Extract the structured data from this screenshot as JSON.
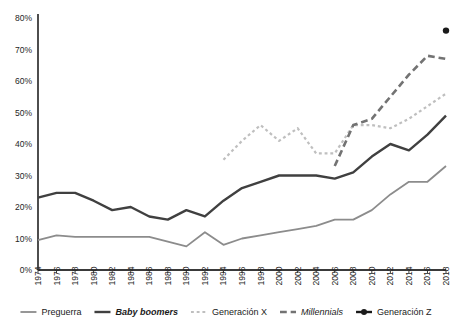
{
  "chart_data": {
    "type": "line",
    "title": "",
    "xlabel": "",
    "ylabel": "",
    "ylim": [
      0,
      0.8
    ],
    "ytick_labels": [
      "0%",
      "10%",
      "20%",
      "30%",
      "40%",
      "50%",
      "60%",
      "70%",
      "80%"
    ],
    "ytick_values": [
      0,
      10,
      20,
      30,
      40,
      50,
      60,
      70,
      80
    ],
    "x": [
      1974,
      1976,
      1978,
      1980,
      1982,
      1984,
      1986,
      1988,
      1990,
      1992,
      1994,
      1996,
      1998,
      2000,
      2002,
      2004,
      2006,
      2008,
      2010,
      2012,
      2014,
      2016,
      2018
    ],
    "xtick_labels": [
      "1974",
      "1976",
      "1978",
      "1980",
      "1982",
      "1984",
      "1986",
      "1988",
      "1990",
      "1992",
      "1994",
      "1996",
      "1998",
      "2000",
      "2002",
      "2004",
      "2006",
      "2008",
      "2010",
      "2012",
      "2014",
      "2016",
      "2018"
    ],
    "grid": false,
    "legend_position": "bottom",
    "series": [
      {
        "name": "Preguerra",
        "color": "#8c8c8c",
        "style": "solid",
        "width": 1.8,
        "marker": "none",
        "x": [
          1974,
          1976,
          1978,
          1980,
          1982,
          1984,
          1986,
          1988,
          1990,
          1992,
          1994,
          1996,
          1998,
          2000,
          2002,
          2004,
          2006,
          2008,
          2010,
          2012,
          2014,
          2016,
          2018
        ],
        "values": [
          9.5,
          11,
          10.5,
          10.5,
          10.5,
          10.5,
          10.5,
          9,
          7.5,
          12,
          8,
          10,
          11,
          12,
          13,
          14,
          16,
          16,
          19,
          24,
          28,
          28,
          33
        ]
      },
      {
        "name": "Baby boomers",
        "color": "#404040",
        "style": "solid",
        "width": 2.4,
        "marker": "none",
        "x": [
          1974,
          1976,
          1978,
          1980,
          1982,
          1984,
          1986,
          1988,
          1990,
          1992,
          1994,
          1996,
          1998,
          2000,
          2002,
          2004,
          2006,
          2008,
          2010,
          2012,
          2014,
          2016,
          2018
        ],
        "values": [
          23,
          24.5,
          24.5,
          22,
          19,
          20,
          17,
          16,
          19,
          17,
          22,
          26,
          28,
          30,
          30,
          30,
          29,
          31,
          36,
          40,
          38,
          43,
          49
        ]
      },
      {
        "name": "Generación X",
        "color": "#bfbfbf",
        "style": "dotted",
        "width": 2.2,
        "marker": "none",
        "x": [
          1994,
          1996,
          1998,
          2000,
          2002,
          2004,
          2006,
          2008,
          2010,
          2012,
          2014,
          2016,
          2018
        ],
        "values": [
          35,
          41,
          46,
          41,
          45,
          37,
          37,
          46,
          46,
          45,
          48,
          52,
          56
        ]
      },
      {
        "name": "Millennials",
        "color": "#737373",
        "style": "dashed",
        "width": 2.6,
        "marker": "none",
        "x": [
          2006,
          2008,
          2010,
          2012,
          2014,
          2016,
          2018
        ],
        "values": [
          33,
          46,
          48,
          55,
          62,
          68,
          67
        ]
      },
      {
        "name": "Generación Z",
        "color": "#1a1a1a",
        "style": "point",
        "width": 2.4,
        "marker": "dot",
        "x": [
          2018
        ],
        "values": [
          76
        ]
      }
    ]
  },
  "legend": {
    "items": [
      {
        "label": "Preguerra",
        "italic": false,
        "bold": false
      },
      {
        "label": "Baby boomers",
        "italic": true,
        "bold": true
      },
      {
        "label": "Generación X",
        "italic": false,
        "bold": false
      },
      {
        "label": "Millennials",
        "italic": true,
        "bold": false
      },
      {
        "label": "Generación Z",
        "italic": false,
        "bold": false
      }
    ]
  }
}
